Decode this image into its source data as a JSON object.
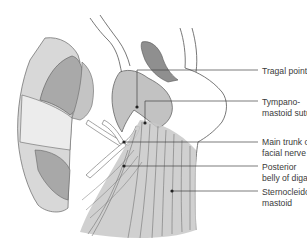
{
  "figure": {
    "type": "anatomical-illustration"
  },
  "labels": [
    {
      "id": "tragal-pointer",
      "lines": [
        "Tragal pointer"
      ],
      "top": 66
    },
    {
      "id": "tympanomastoid-suture",
      "lines": [
        "Tympano-",
        "mastoid suture"
      ],
      "top": 98
    },
    {
      "id": "main-trunk-facial-nerve",
      "lines": [
        "Main trunk of",
        "facial nerve"
      ],
      "top": 137
    },
    {
      "id": "posterior-belly-digastric",
      "lines": [
        "Posterior",
        "belly of digastric"
      ],
      "top": 162
    },
    {
      "id": "sternocleidomastoid",
      "lines": [
        "Sternocleido-",
        "mastoid"
      ],
      "top": 187
    }
  ],
  "colors": {
    "outline": "#555555",
    "light_grey": "#d6d6d6",
    "mid_grey": "#b8b8b8",
    "dark_grey": "#9a9a9a",
    "nerve": "#ffffff",
    "label_text": "#3a3a3a",
    "leader": "#444444"
  }
}
